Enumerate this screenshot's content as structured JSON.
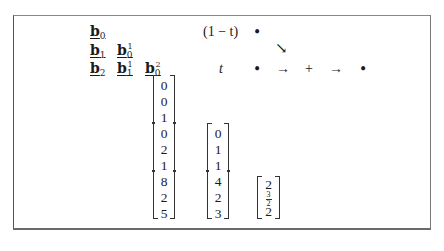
{
  "b_table": {
    "rows": [
      [
        {
          "base": "b",
          "sub": "0",
          "sup": ""
        }
      ],
      [
        {
          "base": "b",
          "sub": "1",
          "sup": ""
        },
        {
          "base": "b",
          "sub": "0",
          "sup": "1"
        }
      ],
      [
        {
          "base": "b",
          "sub": "2",
          "sup": ""
        },
        {
          "base": "b",
          "sub": "1",
          "sup": "1"
        },
        {
          "base": "b",
          "sub": "0",
          "sup": "2"
        }
      ]
    ]
  },
  "diagram": {
    "label_top": "(1 − t)",
    "label_bottom": "t",
    "bullet": "•",
    "diag_arrow": "↘",
    "arrow": "→",
    "plus": "+"
  },
  "matrices": [
    {
      "entries": [
        "0",
        "0",
        "1",
        "0",
        "2",
        "1",
        "8",
        "2",
        "5"
      ],
      "separators_after": [
        3,
        6
      ]
    },
    {
      "entries": [
        "0",
        "1",
        "1",
        "4",
        "2",
        "3"
      ],
      "separators_after": [
        3
      ]
    },
    {
      "entries": [
        "2",
        {
          "num": "3",
          "den": "2"
        },
        "2"
      ],
      "separators_after": []
    }
  ],
  "matrix_display": {
    "m1": [
      "0",
      "0",
      "1",
      "0",
      "2",
      "1",
      "8",
      "2",
      "5"
    ],
    "m2": [
      "0",
      "1",
      "1",
      "4",
      "2",
      "3"
    ],
    "m3_top": "2",
    "m3_mid_num": "3",
    "m3_mid_den": "2",
    "m3_bottom": "2"
  }
}
